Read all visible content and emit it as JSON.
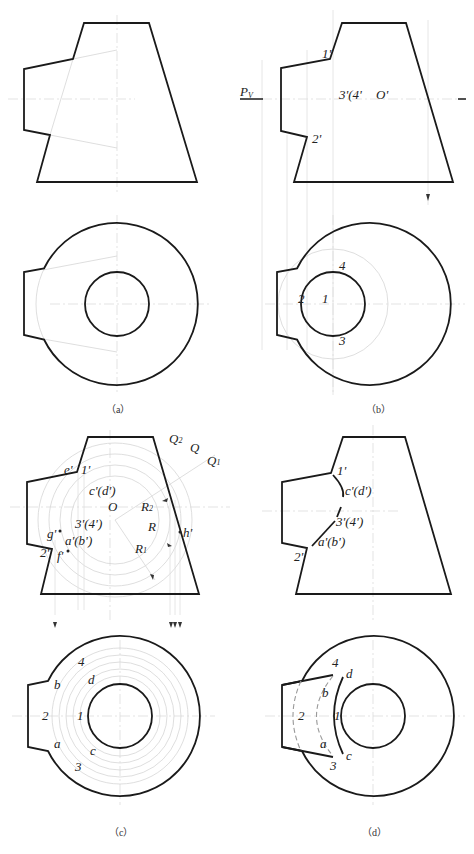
{
  "figure": {
    "panels": [
      {
        "id": "a",
        "caption": "（a）",
        "front_view_labels": [],
        "top_view_labels": []
      },
      {
        "id": "b",
        "caption": "（b）",
        "front_view_labels": [
          "1'",
          "2'",
          "3'(4'",
          "O'",
          "Pv"
        ],
        "top_view_labels": [
          "4",
          "2",
          "1",
          "3"
        ]
      },
      {
        "id": "c",
        "caption": "（c）",
        "front_view_labels": [
          "e'",
          "1'",
          "c'(d')",
          "O",
          "R2",
          "R",
          "R1",
          "3'(4')",
          "g'",
          "a'(b')",
          "f'",
          "2'",
          "h'",
          "Q2",
          "Q",
          "Q1"
        ],
        "top_view_labels": [
          "4",
          "b",
          "d",
          "2",
          "1",
          "a",
          "c",
          "3"
        ]
      },
      {
        "id": "d",
        "caption": "（d）",
        "front_view_labels": [
          "1'",
          "c'(d')",
          "3'(4')",
          "a'(b')",
          "2'"
        ],
        "top_view_labels": [
          "4",
          "d",
          "b",
          "2",
          "1",
          "a",
          "c",
          "3"
        ]
      }
    ]
  },
  "labels": {
    "b": {
      "p1": "1'",
      "p2": "2'",
      "p34": "3'(4'",
      "o": "O'",
      "pv": "P",
      "pv_sub": "V",
      "t4": "4",
      "t2": "2",
      "t1": "1",
      "t3": "3",
      "cap": "（b）"
    },
    "a": {
      "cap": "（a）"
    },
    "c": {
      "e": "e'",
      "p1": "1'",
      "cd": "c'(d')",
      "o": "O",
      "r2": "R",
      "r2_sub": "2",
      "r": "R",
      "r1": "R",
      "r1_sub": "1",
      "p34": "3'(4')",
      "g": "g'",
      "ab": "a'(b')",
      "f": "f'",
      "p2": "2'",
      "h": "h'",
      "q2": "Q",
      "q2_sub": "2",
      "q": "Q",
      "q1": "Q",
      "q1_sub": "1",
      "t4": "4",
      "tb": "b",
      "td": "d",
      "t2": "2",
      "t1": "1",
      "ta": "a",
      "tc": "c",
      "t3": "3",
      "cap": "（c）"
    },
    "d": {
      "p1": "1'",
      "cd": "c'(d')",
      "p34": "3'(4')",
      "ab": "a'(b')",
      "p2": "2'",
      "t4": "4",
      "td": "d",
      "tb": "b",
      "t2": "2",
      "t1": "1",
      "ta": "a",
      "tc": "c",
      "t3": "3",
      "cap": "（d）"
    }
  }
}
